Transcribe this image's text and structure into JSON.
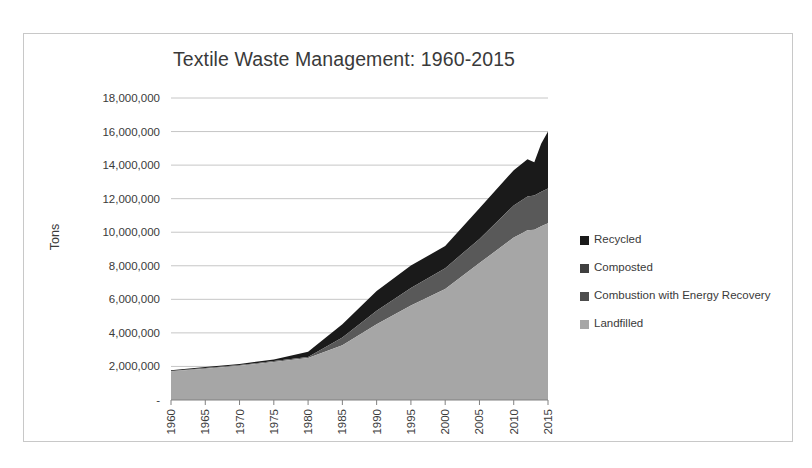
{
  "chart_data": {
    "type": "area",
    "title": "Textile Waste Management: 1960-2015",
    "xlabel": "",
    "ylabel": "Tons",
    "stacked": true,
    "grid": true,
    "legend_position": "right",
    "xlim": [
      1960,
      2015
    ],
    "ylim": [
      0,
      18000000
    ],
    "ytick_labels": [
      "18,000,000",
      "16,000,000",
      "14,000,000",
      "12,000,000",
      "10,000,000",
      "8,000,000",
      "6,000,000",
      "4,000,000",
      "2,000,000",
      "-"
    ],
    "ytick_values": [
      18000000,
      16000000,
      14000000,
      12000000,
      10000000,
      8000000,
      6000000,
      4000000,
      2000000,
      0
    ],
    "xtick_labels": [
      "1960",
      "1965",
      "1970",
      "1975",
      "1980",
      "1985",
      "1990",
      "1995",
      "2000",
      "2005",
      "2010",
      "2015"
    ],
    "xtick_values": [
      1960,
      1965,
      1970,
      1975,
      1980,
      1985,
      1990,
      1995,
      2000,
      2005,
      2010,
      2015
    ],
    "x": [
      1960,
      1965,
      1970,
      1975,
      1980,
      1985,
      1990,
      1995,
      2000,
      2005,
      2010,
      2011,
      2012,
      2013,
      2014,
      2015
    ],
    "stack_order_bottom_to_top": [
      "Landfilled",
      "Combustion with Energy Recovery",
      "Composted",
      "Recycled"
    ],
    "series": [
      {
        "name": "Landfilled",
        "color": "#A6A6A6",
        "values": [
          1710000,
          1870000,
          2040000,
          2270000,
          2500000,
          3260000,
          4510000,
          5630000,
          6620000,
          8160000,
          9680000,
          9900000,
          10120000,
          10150000,
          10350000,
          10530000
        ]
      },
      {
        "name": "Combustion with Energy Recovery",
        "color": "#595959",
        "values": [
          20000,
          30000,
          40000,
          50000,
          60000,
          460000,
          810000,
          1050000,
          1240000,
          1440000,
          1920000,
          1960000,
          2010000,
          2040000,
          2060000,
          2080000
        ]
      },
      {
        "name": "Composted",
        "color": "#404040",
        "values": [
          0,
          0,
          0,
          0,
          0,
          0,
          0,
          0,
          0,
          0,
          0,
          0,
          0,
          0,
          0,
          0
        ]
      },
      {
        "name": "Recycled",
        "color": "#1A1A1A",
        "values": [
          50000,
          60000,
          70000,
          90000,
          320000,
          790000,
          1170000,
          1330000,
          1320000,
          1830000,
          2100000,
          2160000,
          2220000,
          1980000,
          2870000,
          3400000
        ]
      }
    ]
  },
  "legend": {
    "items": [
      {
        "label": "Recycled",
        "color": "#1A1A1A"
      },
      {
        "label": "Composted",
        "color": "#404040"
      },
      {
        "label": "Combustion with Energy Recovery",
        "color": "#4D4D4D"
      },
      {
        "label": "Landfilled",
        "color": "#A6A6A6"
      }
    ]
  }
}
